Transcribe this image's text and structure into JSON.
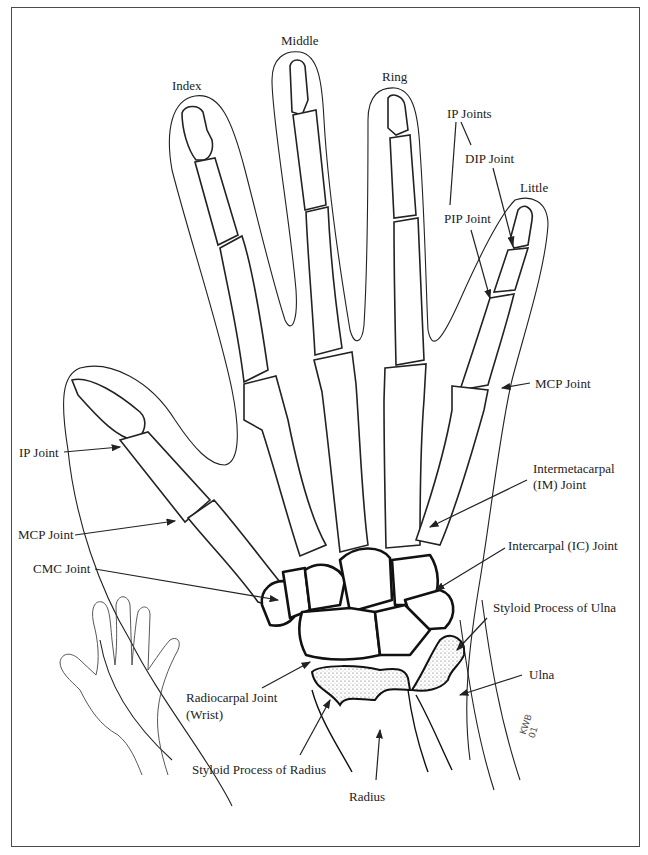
{
  "figure": {
    "signature": [
      "KWB",
      "01"
    ]
  },
  "fingers": {
    "index": "Index",
    "middle": "Middle",
    "ring": "Ring",
    "little": "Little"
  },
  "labels": {
    "ip_joints": "IP Joints",
    "dip_joint": "DIP Joint",
    "pip_joint": "PIP Joint",
    "mcp_joint_right": "MCP Joint",
    "ip_joint_thumb": "IP Joint",
    "mcp_joint_thumb": "MCP Joint",
    "cmc_joint": "CMC Joint",
    "im_joint_line1": "Intermetacarpal",
    "im_joint_line2": "(IM) Joint",
    "ic_joint": "Intercarpal (IC) Joint",
    "styloid_ulna": "Styloid Process of Ulna",
    "ulna": "Ulna",
    "radiocarpal_line1": "Radiocarpal Joint",
    "radiocarpal_line2": "(Wrist)",
    "styloid_radius": "Styloid Process of Radius",
    "radius": "Radius"
  },
  "colors": {
    "ink": "#222222",
    "frame": "#4a4a4a",
    "background": "#ffffff"
  }
}
